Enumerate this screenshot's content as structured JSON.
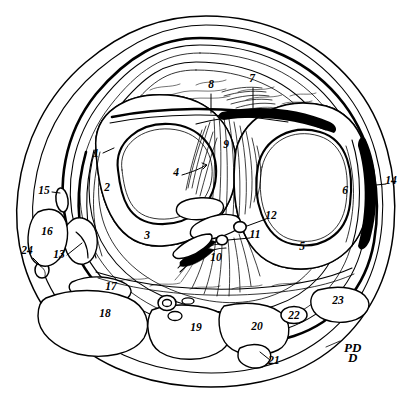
{
  "figure": {
    "background_color": "#ffffff",
    "ink_color": "#000000",
    "signature": "PD",
    "label_count": 24
  },
  "labels": [
    {
      "id": "1",
      "text": "1",
      "x": 96,
      "y": 157,
      "leader": true,
      "region": "left-condyle-cortex"
    },
    {
      "id": "2",
      "text": "2",
      "x": 107,
      "y": 191,
      "leader": false,
      "region": "left-condyle-spongiosa"
    },
    {
      "id": "3",
      "text": "3",
      "x": 147,
      "y": 239,
      "leader": false,
      "region": "left-condyle-marrow"
    },
    {
      "id": "4",
      "text": "4",
      "x": 176,
      "y": 176,
      "leader": true,
      "region": "left-condyle-center"
    },
    {
      "id": "5",
      "text": "5",
      "x": 302,
      "y": 250,
      "leader": false,
      "region": "right-condyle-marrow"
    },
    {
      "id": "6",
      "text": "6",
      "x": 345,
      "y": 194,
      "leader": false,
      "region": "right-condyle-spongiosa"
    },
    {
      "id": "7",
      "text": "7",
      "x": 252,
      "y": 82,
      "leader": true,
      "region": "anterior-tendon"
    },
    {
      "id": "8",
      "text": "8",
      "x": 211,
      "y": 88,
      "leader": true,
      "region": "anterior-capsule"
    },
    {
      "id": "9",
      "text": "9",
      "x": 226,
      "y": 148,
      "leader": false,
      "region": "intercondylar-ligament"
    },
    {
      "id": "10",
      "text": "10",
      "x": 216,
      "y": 261,
      "leader": false,
      "region": "posterior-cruciate"
    },
    {
      "id": "11",
      "text": "11",
      "x": 255,
      "y": 238,
      "leader": true,
      "region": "small-vessel-inferior"
    },
    {
      "id": "12",
      "text": "12",
      "x": 271,
      "y": 219,
      "leader": true,
      "region": "small-vessel-superior"
    },
    {
      "id": "13",
      "text": "13",
      "x": 59,
      "y": 258,
      "leader": true,
      "region": "medial-collateral"
    },
    {
      "id": "14",
      "text": "14",
      "x": 391,
      "y": 184,
      "leader": true,
      "region": "lateral-capsule"
    },
    {
      "id": "15",
      "text": "15",
      "x": 44,
      "y": 194,
      "leader": true,
      "region": "medial-vessel"
    },
    {
      "id": "16",
      "text": "16",
      "x": 47,
      "y": 235,
      "leader": false,
      "region": "medial-muscle"
    },
    {
      "id": "17",
      "text": "17",
      "x": 111,
      "y": 290,
      "leader": false,
      "region": "posteromedial-muscle"
    },
    {
      "id": "18",
      "text": "18",
      "x": 105,
      "y": 317,
      "leader": false,
      "region": "posterior-muscle-large"
    },
    {
      "id": "19",
      "text": "19",
      "x": 196,
      "y": 331,
      "leader": false,
      "region": "posterior-muscle-mid"
    },
    {
      "id": "20",
      "text": "20",
      "x": 257,
      "y": 330,
      "leader": false,
      "region": "posterolateral-muscle"
    },
    {
      "id": "21",
      "text": "21",
      "x": 274,
      "y": 364,
      "leader": true,
      "region": "small-posterior-structure"
    },
    {
      "id": "22",
      "text": "22",
      "x": 294,
      "y": 315,
      "leader": false,
      "region": "small-vessel-posterior"
    },
    {
      "id": "23",
      "text": "23",
      "x": 338,
      "y": 304,
      "leader": false,
      "region": "lateral-muscle"
    },
    {
      "id": "24",
      "text": "24",
      "x": 27,
      "y": 254,
      "leader": true,
      "region": "small-vessel-medial"
    }
  ]
}
